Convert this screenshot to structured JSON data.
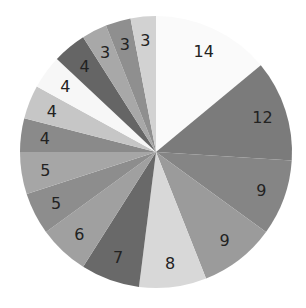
{
  "chart_data": {
    "type": "pie",
    "title": "",
    "values": [
      14,
      12,
      9,
      9,
      8,
      7,
      6,
      5,
      5,
      4,
      4,
      4,
      4,
      3,
      3,
      3
    ],
    "labels": [
      "14",
      "12",
      "9",
      "9",
      "8",
      "7",
      "6",
      "5",
      "5",
      "4",
      "4",
      "4",
      "4",
      "3",
      "3",
      "3"
    ],
    "colors": [
      "#fafafa",
      "#7b7b7b",
      "#858585",
      "#9b9b9b",
      "#d8d8d8",
      "#696969",
      "#a0a0a0",
      "#8d8d8d",
      "#a6a6a6",
      "#8a8a8a",
      "#c6c6c6",
      "#f7f7f7",
      "#656565",
      "#a8a8a8",
      "#8f8f8f",
      "#d2d2d2"
    ],
    "start_angle_deg": 0,
    "direction": "clockwise",
    "legend": false
  }
}
